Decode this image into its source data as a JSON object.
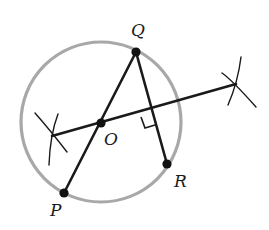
{
  "diagram": {
    "colors": {
      "circle": "#a8a8a8",
      "lines": "#1a1a1a",
      "points": "#111111",
      "background": "#ffffff"
    },
    "circle": {
      "cx": 101,
      "cy": 122,
      "r": 80
    },
    "points": [
      {
        "id": "Q",
        "label": "Q",
        "x": 136,
        "y": 52,
        "label_x": 131,
        "label_y": 36
      },
      {
        "id": "O",
        "label": "O",
        "x": 101,
        "y": 123,
        "label_x": 104,
        "label_y": 145
      },
      {
        "id": "P",
        "label": "P",
        "x": 64,
        "y": 193,
        "label_x": 50,
        "label_y": 216
      },
      {
        "id": "R",
        "label": "R",
        "x": 167,
        "y": 164,
        "label_x": 174,
        "label_y": 187
      }
    ],
    "segments": [
      {
        "name": "PQ",
        "x1": 64,
        "y1": 193,
        "x2": 136,
        "y2": 52
      },
      {
        "name": "QR",
        "x1": 136,
        "y1": 52,
        "x2": 167,
        "y2": 164
      },
      {
        "name": "bisector",
        "x1": 52,
        "y1": 136,
        "x2": 236,
        "y2": 84
      }
    ],
    "right_angle_marker": "M141,117 L145,128 L155,125",
    "construction_arcs": [
      "M35,113 Q50,130 67,152",
      "M58,114 Q50,135 49,165",
      "M222,73 Q232,80 256,107",
      "M241,57 Q238,82 228,105"
    ]
  }
}
